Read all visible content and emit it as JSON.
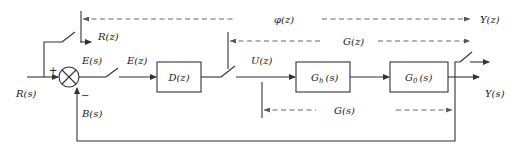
{
  "diagram": {
    "title": "",
    "type": "sampled-data closed-loop control block diagram",
    "colors": {
      "line": "#333333",
      "dashed": "#555555",
      "background": "#ffffff"
    },
    "signals": {
      "input": "R(s)",
      "sampled_input": "R(z)",
      "error": "E(s)",
      "sampled_error": "E(z)",
      "control": "U(z)",
      "output": "Y(s)",
      "sampled_output": "Y(z)",
      "feedback": "B(s)"
    },
    "blocks": [
      {
        "id": "controller",
        "label": "D(z)"
      },
      {
        "id": "hold",
        "label": "G",
        "subscript": "h",
        "suffix": "(s)"
      },
      {
        "id": "plant",
        "label": "G",
        "subscript": "0",
        "suffix": "(s)"
      }
    ],
    "summing_junction": {
      "plus_sign": "+",
      "minus_sign": "−"
    },
    "transfer_labels": {
      "closed_loop": "φ(z)",
      "open_loop_pulse": "G(z)",
      "open_loop_continuous": "G(s)"
    },
    "samplers": [
      "input-sampler",
      "error-sampler",
      "controller-output-sampler",
      "output-sampler"
    ]
  }
}
